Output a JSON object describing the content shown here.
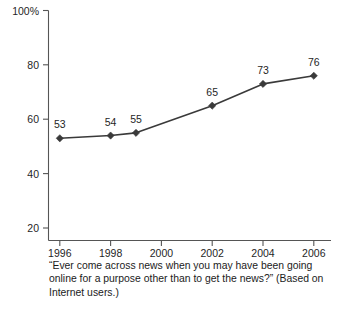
{
  "chart_data": {
    "type": "line",
    "title": "",
    "subtitle": "",
    "xlabel": "",
    "ylabel": "",
    "x": [
      1996,
      1998,
      1999,
      2002,
      2004,
      2006
    ],
    "values": [
      53,
      54,
      55,
      65,
      73,
      76
    ],
    "point_labels": [
      "53",
      "54",
      "55",
      "65",
      "73",
      "76"
    ],
    "xlim": [
      1995.4,
      2006.8
    ],
    "ylim": [
      16,
      100
    ],
    "xticks": [
      1996,
      1998,
      2000,
      2002,
      2004,
      2006
    ],
    "xtick_labels": [
      "1996",
      "1998",
      "2000",
      "2002",
      "2004",
      "2006"
    ],
    "yticks": [
      20,
      40,
      60,
      80,
      100
    ],
    "ytick_labels": [
      "20",
      "40",
      "60",
      "80",
      "100%"
    ],
    "grid": false,
    "legend": "none",
    "series_color": "#3a3a3a",
    "axis_color": "#555555",
    "marker": "diamond",
    "caption": "“Ever come across news when you may have been going online for a purpose other than to get the news?” (Based on Internet users.)"
  },
  "figure": {
    "caption": "“Ever come across news when you may have been going online for a purpose other than to get the news?” (Based on Internet users.)",
    "source_note": ""
  }
}
